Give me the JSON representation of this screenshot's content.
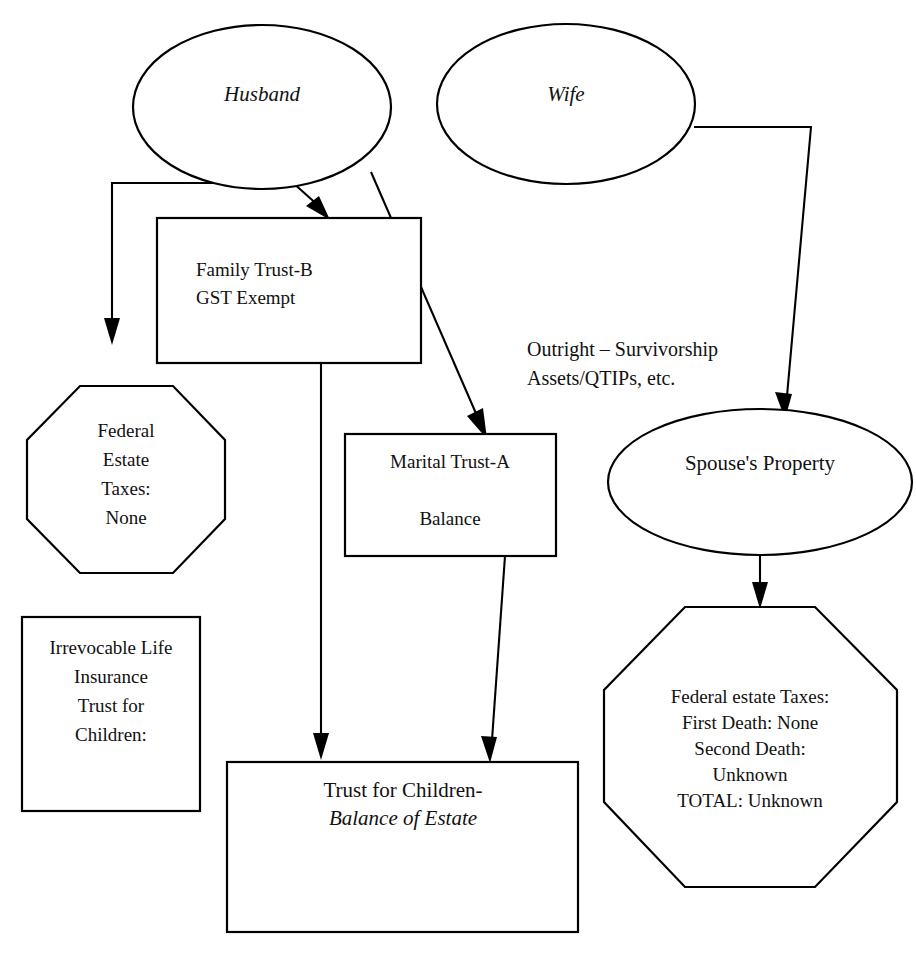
{
  "diagram": {
    "background_color": "#ffffff",
    "line_color": "#000000",
    "text_color": "#111111",
    "nodes": {
      "husband": {
        "shape": "ellipse",
        "label": "Husband",
        "style": "italic"
      },
      "wife": {
        "shape": "ellipse",
        "label": "Wife",
        "style": "italic"
      },
      "family_trust": {
        "shape": "rectangle",
        "line1": "Family Trust-B",
        "line2": "GST Exempt"
      },
      "marital_trust": {
        "shape": "rectangle",
        "line1": "Marital Trust-A",
        "line2": "Balance"
      },
      "left_octagon": {
        "shape": "octagon",
        "line1": "Federal",
        "line2": "Estate",
        "line3": "Taxes:",
        "line4": "None"
      },
      "ilit_box": {
        "shape": "rectangle",
        "line1": "Irrevocable Life",
        "line2": "Insurance",
        "line3": "Trust for",
        "line4": "Children:"
      },
      "spouse_property": {
        "shape": "ellipse",
        "label": "Spouse's Property"
      },
      "right_octagon": {
        "shape": "octagon",
        "line1": "Federal estate Taxes:",
        "line2": "First Death: None",
        "line3": "Second Death:",
        "line4": "Unknown",
        "line5": "TOTAL: Unknown"
      },
      "children_trust": {
        "shape": "rectangle",
        "line1": "Trust for Children-",
        "line2": "Balance of Estate",
        "line2_style": "italic"
      }
    },
    "annotations": {
      "outright_note": {
        "line1": "Outright – Survivorship",
        "line2": "Assets/QTIPs, etc."
      }
    },
    "connectors": [
      {
        "name": "husband-to-left-octagon",
        "from": "husband",
        "to": "left_octagon",
        "style": "elbow",
        "arrow": true
      },
      {
        "name": "husband-to-family-trust",
        "from": "husband",
        "to": "family_trust",
        "style": "short-diagonal",
        "arrow": true
      },
      {
        "name": "husband-to-marital-trust",
        "from": "husband",
        "to": "marital_trust",
        "style": "diagonal",
        "arrow": true
      },
      {
        "name": "wife-to-spouse-property",
        "from": "wife",
        "to": "spouse_property",
        "style": "elbow",
        "arrow": true
      },
      {
        "name": "family-trust-to-children-trust",
        "from": "family_trust",
        "to": "children_trust",
        "style": "vertical",
        "arrow": true
      },
      {
        "name": "marital-trust-to-children-trust",
        "from": "marital_trust",
        "to": "children_trust",
        "style": "vertical",
        "arrow": true
      },
      {
        "name": "spouse-property-to-right-octagon",
        "from": "spouse_property",
        "to": "right_octagon",
        "style": "vertical",
        "arrow": true
      }
    ]
  }
}
